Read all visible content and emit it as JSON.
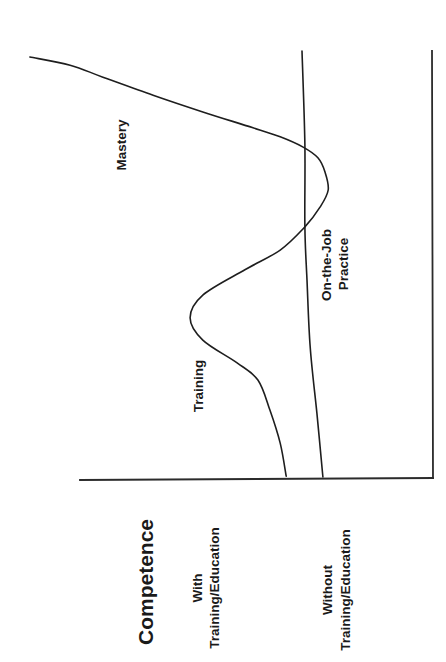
{
  "chart_data": {
    "type": "line",
    "orientation": "rotated 90 degrees counter-clockwise (time runs bottom-to-top, competence increases right-to-left)",
    "title": "",
    "xlabel": "",
    "ylabel": "Competence",
    "y_categories": [
      {
        "line1": "With",
        "line2": "Training/Education"
      },
      {
        "line1": "Without",
        "line2": "Training/Education"
      }
    ],
    "xlim": [
      0,
      100
    ],
    "ylim": [
      0,
      115
    ],
    "grid": false,
    "legend": "none",
    "annotations": {
      "mastery": "Mastery",
      "training": "Training",
      "on_the_job_line1": "On-the-Job",
      "on_the_job_line2": "Practice"
    },
    "series": [
      {
        "name": "With Training/Education",
        "phases": [
          "Training",
          "Mastery"
        ],
        "points": [
          [
            0.9,
            41.6
          ],
          [
            8.6,
            43.3
          ],
          [
            16.3,
            46.2
          ],
          [
            23.3,
            49.6
          ],
          [
            27.3,
            55.5
          ],
          [
            32.6,
            65.2
          ],
          [
            37.8,
            68.8
          ],
          [
            43.1,
            65.2
          ],
          [
            49.0,
            53.3
          ],
          [
            53.6,
            43.3
          ],
          [
            59.0,
            36.3
          ],
          [
            63.6,
            32.0
          ],
          [
            67.6,
            29.7
          ],
          [
            71.8,
            30.6
          ],
          [
            75.1,
            32.6
          ],
          [
            77.6,
            36.8
          ],
          [
            80.0,
            43.3
          ],
          [
            82.1,
            51.0
          ],
          [
            85.8,
            65.2
          ],
          [
            89.7,
            79.3
          ],
          [
            93.9,
            93.5
          ],
          [
            96.7,
            102.8
          ],
          [
            98.6,
            114.2
          ]
        ]
      },
      {
        "name": "Without Training/Education",
        "phases": [
          "On-the-Job Practice"
        ],
        "points": [
          [
            0.7,
            31.2
          ],
          [
            15.6,
            32.9
          ],
          [
            31.0,
            34.8
          ],
          [
            46.6,
            35.7
          ],
          [
            59.0,
            36.3
          ],
          [
            78.1,
            36.3
          ],
          [
            100.0,
            37.1
          ]
        ]
      }
    ]
  }
}
